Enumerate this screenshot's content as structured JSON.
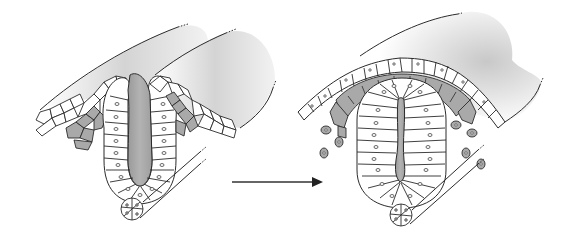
{
  "figure": {
    "panels": [
      {
        "id": "stage-1",
        "name": "neural-groove-stage"
      },
      {
        "id": "stage-2",
        "name": "neural-tube-stage"
      }
    ],
    "arrow": {
      "direction": "right"
    },
    "colors": {
      "background": "#ffffff",
      "outline": "#2b2b2b",
      "cell_fill": "#ffffff",
      "neural_crest_fill": "#a9a9a9",
      "lumen_fill": "#a8a8a8",
      "surface_shade": "#cfcfcf"
    }
  }
}
